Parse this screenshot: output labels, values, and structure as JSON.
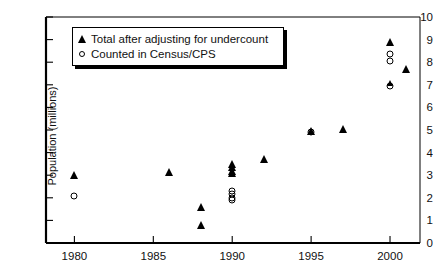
{
  "chart_data": {
    "type": "scatter",
    "title": "",
    "xlabel": "",
    "ylabel": "Population (millions)",
    "xlim": [
      1978.2,
      2001.9
    ],
    "ylim": [
      0,
      10
    ],
    "xticks": [
      1980,
      1985,
      1990,
      1995,
      2000
    ],
    "yticks": [
      0,
      1,
      2,
      3,
      4,
      5,
      6,
      7,
      8,
      9,
      10
    ],
    "grid": false,
    "legend_position": "top-left-inside",
    "series": [
      {
        "name": "Total after adjusting for undercount",
        "marker": "filled-triangle",
        "points": [
          {
            "x": 1980,
            "y": 3.0
          },
          {
            "x": 1986,
            "y": 3.15
          },
          {
            "x": 1988,
            "y": 1.6
          },
          {
            "x": 1988,
            "y": 0.8
          },
          {
            "x": 1990,
            "y": 3.5
          },
          {
            "x": 1990,
            "y": 3.35
          },
          {
            "x": 1990,
            "y": 3.2
          },
          {
            "x": 1990,
            "y": 3.1
          },
          {
            "x": 1992,
            "y": 3.7
          },
          {
            "x": 1995,
            "y": 4.95
          },
          {
            "x": 1997,
            "y": 5.05
          },
          {
            "x": 2000,
            "y": 8.9
          },
          {
            "x": 2000,
            "y": 7.1
          },
          {
            "x": 2001,
            "y": 7.7
          }
        ]
      },
      {
        "name": "Counted in Census/CPS",
        "marker": "open-circle",
        "points": [
          {
            "x": 1980,
            "y": 2.1
          },
          {
            "x": 1990,
            "y": 2.3
          },
          {
            "x": 1990,
            "y": 2.15
          },
          {
            "x": 1990,
            "y": 2.0
          },
          {
            "x": 1990,
            "y": 1.9
          },
          {
            "x": 1995,
            "y": 4.9
          },
          {
            "x": 2000,
            "y": 8.35
          },
          {
            "x": 2000,
            "y": 8.05
          },
          {
            "x": 2000,
            "y": 6.95
          }
        ]
      }
    ]
  },
  "legend": {
    "items": [
      {
        "label": "Total after adjusting for undercount",
        "marker": "filled-triangle"
      },
      {
        "label": "Counted in Census/CPS",
        "marker": "open-circle"
      }
    ]
  },
  "axis": {
    "y_title": "Population (millions)",
    "y_tick_labels": [
      "10",
      "9",
      "8",
      "7",
      "6",
      "5",
      "4",
      "3",
      "2",
      "1",
      "0"
    ],
    "x_tick_labels": [
      "1980",
      "1985",
      "1990",
      "1995",
      "2000"
    ]
  },
  "colors": {
    "ink": "#000000",
    "background": "#ffffff"
  }
}
